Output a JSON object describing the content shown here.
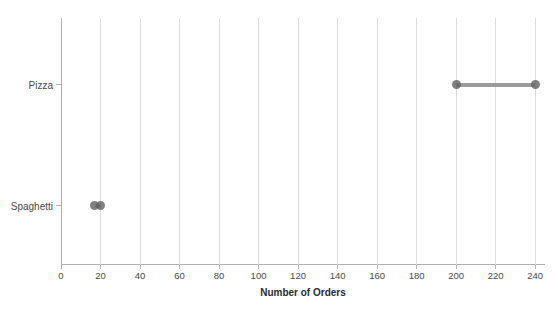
{
  "chart_data": {
    "type": "dumbbell",
    "orientation": "horizontal",
    "title": "",
    "xlabel": "Number of Orders",
    "ylabel": "",
    "categories": [
      "Pizza",
      "Spaghetti"
    ],
    "rows": [
      {
        "label": "Pizza",
        "min": 200,
        "max": 240
      },
      {
        "label": "Spaghetti",
        "min": 17,
        "max": 20
      }
    ],
    "xlim": [
      0,
      245
    ],
    "xticks": [
      0,
      20,
      40,
      60,
      80,
      100,
      120,
      140,
      160,
      180,
      200,
      220,
      240
    ],
    "grid": "vertical",
    "legend": "none",
    "colors": {
      "background": "#ffffff",
      "gridline": "#dcdcdc",
      "axis_spine": "#b0b0b0",
      "dumbbell_line": "#9b9b9b",
      "dumbbell_dot": "#606060",
      "tick_label": "#4a4a4a",
      "category_label": "#4a4a4a",
      "axis_label": "#2b2b2b"
    }
  }
}
